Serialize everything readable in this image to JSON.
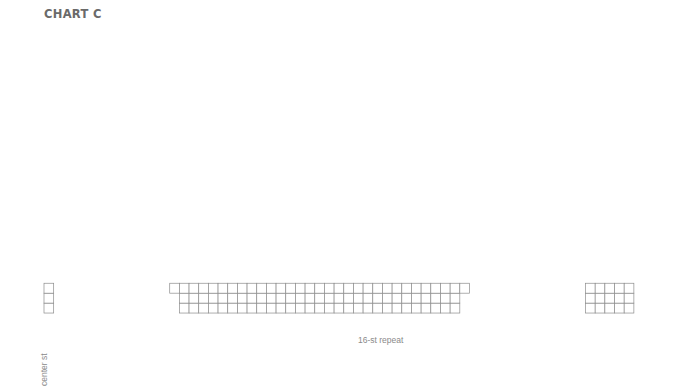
{
  "title": "CHART C",
  "grid": {
    "left": 44,
    "top": 35,
    "cell_w": 9.67,
    "cell_h": 9.93,
    "num_cols": 61,
    "num_rows": 28,
    "line_color": "#8c8c8c",
    "symbol_color": "#8c8c8c",
    "center_col_index": 0,
    "main_block": {
      "start_index": 14,
      "end_index": 42
    },
    "edge_block": {
      "start_index": 56,
      "end_index": 60
    },
    "wedge_step_rows": 2
  },
  "row_labels": {
    "left_even": [
      "28",
      "26",
      "24",
      "22",
      "20",
      "18",
      "16",
      "14",
      "12",
      "10",
      "8",
      "6",
      "4",
      "2"
    ],
    "right_odd": [
      "27",
      "25",
      "23",
      "21",
      "19",
      "17",
      "15",
      "13",
      "11",
      "9",
      "7",
      "5",
      "3",
      "1"
    ]
  },
  "col_labels": [
    {
      "text": "35",
      "index": 0
    },
    {
      "text": "33",
      "index": 15
    },
    {
      "text": "31",
      "index": 17
    },
    {
      "text": "29",
      "index": 19
    },
    {
      "text": "27",
      "index": 21
    },
    {
      "text": "25",
      "index": 23
    },
    {
      "text": "23",
      "index": 25
    },
    {
      "text": "21",
      "index": 27
    },
    {
      "text": "19",
      "index": 29
    },
    {
      "text": "17",
      "index": 31
    },
    {
      "text": "15",
      "index": 33
    },
    {
      "text": "13",
      "index": 35
    },
    {
      "text": "11",
      "index": 37
    },
    {
      "text": "9",
      "index": 39
    },
    {
      "text": "7",
      "index": 41
    },
    {
      "text": "5",
      "index": 56
    },
    {
      "text": "3",
      "index": 58
    },
    {
      "text": "1",
      "index": 60
    }
  ],
  "repeat": {
    "label": "16-st repeat",
    "start_x": 310,
    "end_x": 462,
    "y": 340
  },
  "center_label": "center st",
  "symbols": [
    {
      "row": 27,
      "items": [
        [
          11,
          "ssk"
        ],
        [
          12,
          "yo"
        ],
        [
          27,
          "ssk"
        ],
        [
          28,
          "yo"
        ],
        [
          43,
          "ssk"
        ],
        [
          44,
          "yo"
        ]
      ]
    },
    {
      "row": 25,
      "items": [
        [
          10,
          "ssk"
        ],
        [
          11,
          "yo"
        ],
        [
          13,
          "yo"
        ],
        [
          14,
          "k2tog"
        ],
        [
          26,
          "ssk"
        ],
        [
          27,
          "yo"
        ],
        [
          29,
          "yo"
        ],
        [
          30,
          "k2tog"
        ],
        [
          42,
          "ssk"
        ],
        [
          43,
          "yo"
        ],
        [
          45,
          "yo"
        ],
        [
          46,
          "k2tog"
        ]
      ]
    },
    {
      "row": 23,
      "items": [
        [
          11,
          "ssk"
        ],
        [
          12,
          "yo"
        ],
        [
          19,
          "yo"
        ],
        [
          20,
          "cdd"
        ],
        [
          21,
          "yo"
        ],
        [
          27,
          "ssk"
        ],
        [
          28,
          "yo"
        ],
        [
          35,
          "yo"
        ],
        [
          36,
          "cdd"
        ],
        [
          37,
          "yo"
        ],
        [
          43,
          "ssk"
        ],
        [
          44,
          "yo"
        ]
      ]
    },
    {
      "row": 21,
      "items": [
        [
          18,
          "yo"
        ],
        [
          19,
          "k2tog"
        ],
        [
          21,
          "ssk"
        ],
        [
          22,
          "yo"
        ],
        [
          34,
          "yo"
        ],
        [
          35,
          "k2tog"
        ],
        [
          37,
          "ssk"
        ],
        [
          38,
          "yo"
        ]
      ]
    },
    {
      "row": 19,
      "items": [
        [
          17,
          "yo"
        ],
        [
          18,
          "k2tog"
        ],
        [
          22,
          "ssk"
        ],
        [
          23,
          "yo"
        ],
        [
          33,
          "yo"
        ],
        [
          34,
          "k2tog"
        ],
        [
          38,
          "ssk"
        ],
        [
          39,
          "yo"
        ]
      ]
    },
    {
      "row": 17,
      "items": [
        [
          17,
          "ssk"
        ],
        [
          18,
          "yo"
        ],
        [
          22,
          "yo"
        ],
        [
          23,
          "k2tog"
        ],
        [
          33,
          "ssk"
        ],
        [
          34,
          "yo"
        ],
        [
          38,
          "yo"
        ],
        [
          39,
          "k2tog"
        ]
      ]
    },
    {
      "row": 15,
      "items": [
        [
          18,
          "ssk"
        ],
        [
          19,
          "yo"
        ],
        [
          21,
          "yo"
        ],
        [
          22,
          "k2tog"
        ],
        [
          34,
          "ssk"
        ],
        [
          35,
          "yo"
        ],
        [
          37,
          "yo"
        ],
        [
          38,
          "k2tog"
        ]
      ]
    },
    {
      "row": 13,
      "items": [
        [
          16,
          "ssk"
        ],
        [
          17,
          "yo"
        ],
        [
          23,
          "yo"
        ],
        [
          24,
          "k2tog"
        ],
        [
          32,
          "ssk"
        ],
        [
          33,
          "yo"
        ],
        [
          39,
          "yo"
        ],
        [
          40,
          "k2tog"
        ]
      ]
    },
    {
      "row": 11,
      "items": [
        [
          14,
          "ssk"
        ],
        [
          15,
          "yo"
        ],
        [
          17,
          "ssk"
        ],
        [
          18,
          "yo"
        ],
        [
          22,
          "yo"
        ],
        [
          23,
          "k2tog"
        ],
        [
          25,
          "yo"
        ],
        [
          26,
          "k2tog"
        ],
        [
          30,
          "ssk"
        ],
        [
          31,
          "yo"
        ],
        [
          33,
          "ssk"
        ],
        [
          34,
          "yo"
        ],
        [
          38,
          "yo"
        ],
        [
          39,
          "k2tog"
        ],
        [
          41,
          "yo"
        ],
        [
          42,
          "k2tog"
        ]
      ]
    },
    {
      "row": 9,
      "items": [
        [
          15,
          "ssk"
        ],
        [
          16,
          "yo"
        ],
        [
          18,
          "ssk"
        ],
        [
          19,
          "yo"
        ],
        [
          21,
          "yo"
        ],
        [
          22,
          "k2tog"
        ],
        [
          24,
          "yo"
        ],
        [
          25,
          "k2tog"
        ],
        [
          31,
          "ssk"
        ],
        [
          32,
          "yo"
        ],
        [
          34,
          "ssk"
        ],
        [
          35,
          "yo"
        ],
        [
          37,
          "yo"
        ],
        [
          38,
          "k2tog"
        ],
        [
          40,
          "yo"
        ],
        [
          41,
          "k2tog"
        ]
      ]
    },
    {
      "row": 7,
      "items": [
        [
          16,
          "ssk"
        ],
        [
          17,
          "yo"
        ],
        [
          18,
          "ssk"
        ],
        [
          19,
          "yo"
        ],
        [
          21,
          "yo"
        ],
        [
          22,
          "k2tog"
        ],
        [
          23,
          "yo"
        ],
        [
          24,
          "k2tog"
        ],
        [
          32,
          "ssk"
        ],
        [
          33,
          "yo"
        ],
        [
          34,
          "ssk"
        ],
        [
          35,
          "yo"
        ],
        [
          37,
          "yo"
        ],
        [
          38,
          "k2tog"
        ],
        [
          39,
          "yo"
        ],
        [
          40,
          "k2tog"
        ]
      ]
    },
    {
      "row": 5,
      "items": [
        [
          17,
          "ssk"
        ],
        [
          18,
          "yo"
        ],
        [
          22,
          "yo"
        ],
        [
          23,
          "k2tog"
        ],
        [
          33,
          "ssk"
        ],
        [
          34,
          "yo"
        ],
        [
          38,
          "yo"
        ],
        [
          39,
          "k2tog"
        ]
      ]
    },
    {
      "row": 3,
      "items": [
        [
          18,
          "ssk"
        ],
        [
          19,
          "yo"
        ],
        [
          21,
          "yo"
        ],
        [
          22,
          "k2tog"
        ],
        [
          34,
          "ssk"
        ],
        [
          35,
          "yo"
        ],
        [
          37,
          "yo"
        ],
        [
          38,
          "k2tog"
        ]
      ]
    }
  ]
}
